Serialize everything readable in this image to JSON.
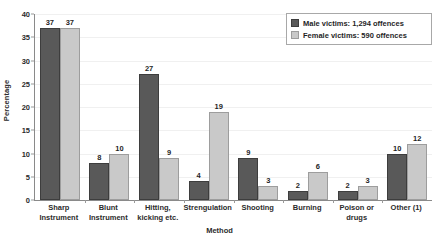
{
  "chart_data": {
    "type": "bar",
    "title": "",
    "xlabel": "Method",
    "ylabel": "Percentage",
    "ylim": [
      0,
      40
    ],
    "yticks": [
      0,
      5,
      10,
      15,
      20,
      25,
      30,
      35,
      40
    ],
    "grid": true,
    "legend_position": "top-right",
    "categories": [
      "Sharp Instrument",
      "Blunt Instrument",
      "Hitting, kicking etc.",
      "Strengulation",
      "Shooting",
      "Burning",
      "Poison or drugs",
      "Other (1)"
    ],
    "category_lines": [
      [
        "Sharp",
        "Instrument"
      ],
      [
        "Blunt",
        "Instrument"
      ],
      [
        "Hitting,",
        "kicking etc."
      ],
      [
        "Strengulation"
      ],
      [
        "Shooting"
      ],
      [
        "Burning"
      ],
      [
        "Poison or",
        "drugs"
      ],
      [
        "Other (1)"
      ]
    ],
    "series": [
      {
        "name": "Male victims: 1,294 offences",
        "color": "#595959",
        "values": [
          37,
          8,
          27,
          4,
          9,
          2,
          2,
          10
        ]
      },
      {
        "name": "Female victims: 590 offences",
        "color": "#c9c9c9",
        "values": [
          37,
          10,
          9,
          19,
          3,
          6,
          3,
          12
        ]
      }
    ]
  },
  "legend": {
    "entries": [
      {
        "label": "Male victims: 1,294 offences"
      },
      {
        "label": "Female victims: 590 offences"
      }
    ]
  }
}
